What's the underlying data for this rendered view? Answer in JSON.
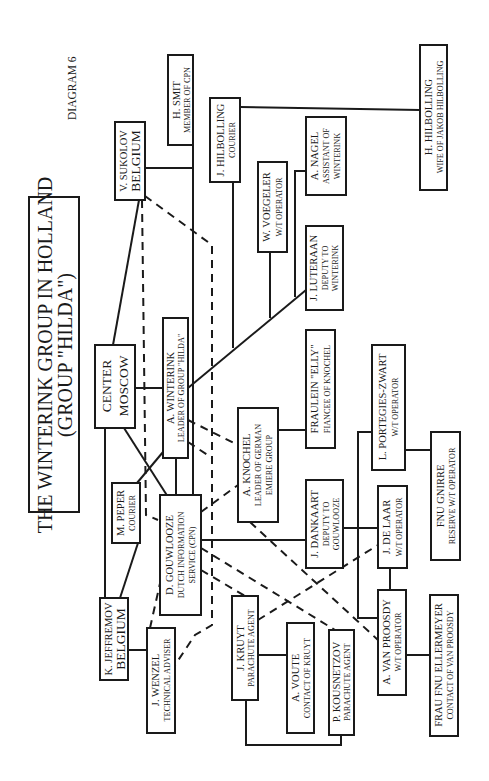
{
  "diagram": {
    "label": "DIAGRAM 6",
    "title_line1": "THE WINTERINK GROUP IN HOLLAND",
    "title_line2": "(GROUP \"HILDA\")",
    "orientation": "rotated 90deg counter-clockwise"
  },
  "nodes": {
    "sukolov": {
      "name": "V. SUKOLOV",
      "role": "BELGIUM"
    },
    "smit": {
      "name": "H. SMIT",
      "role": "MEMBER OF CPN"
    },
    "j_hilbolling": {
      "name": "J. HILBOLLING",
      "role": "COURIER"
    },
    "h_hilbolling": {
      "name": "H. HILBOLLING",
      "role": "WIFE OF JAKOB HILBOLLING"
    },
    "nagel": {
      "name": "A. NAGEL",
      "role1": "ASSISTANT OF",
      "role2": "WINTERINK"
    },
    "voegeler": {
      "name": "W. VOEGELER",
      "role": "W/T OPERATOR"
    },
    "luteraan": {
      "name": "J. LUTERAAN",
      "role1": "DEPUTY TO",
      "role2": "WINTERINK"
    },
    "center": {
      "name": "CENTER",
      "role": "MOSCOW"
    },
    "winterink": {
      "name": "A. WINTERINK",
      "role": "LEADER OF GROUP \"HILDA\""
    },
    "knochel": {
      "name": "A. KNOCHEL",
      "role1": "LEADER OF GERMAN",
      "role2": "EMIERE GROUP"
    },
    "elly": {
      "name": "FRAULEIN \"ELLY\"",
      "role": "FIANCEE OF KNOCHEL"
    },
    "peper": {
      "name": "M. PEPER",
      "role": "COURIER"
    },
    "gouwlooze": {
      "name": "D. GOUWLOOZE",
      "role1": "DUTCH INFORMATION",
      "role2": "SERVICE (CPN)"
    },
    "jeffremov": {
      "name": "K. JEFFREMOV",
      "role": "BELGIUM"
    },
    "wenzel": {
      "name": "J. WENZEL",
      "role": "TECHNICAL ADVISER"
    },
    "kruyt": {
      "name": "J. KRUYT",
      "role": "PARACHUTE AGENT"
    },
    "voute": {
      "name": "A. VOUTE",
      "role": "CONTACT OF KRUYT"
    },
    "kousnetzov": {
      "name": "P. KOUSNETZOV",
      "role": "PARACHUTE AGENT"
    },
    "dankaart": {
      "name": "J. DANKAART",
      "role1": "DEPUTY TO",
      "role2": "GOUWLOOZE"
    },
    "delaar": {
      "name": "J. DE LAAR",
      "role": "W/T OPERATOR"
    },
    "portegies": {
      "name": "L. PORTEGIES-ZWART",
      "role": "W/T OPERATOR"
    },
    "gnirre": {
      "name": "FNU GNIRRE",
      "role": "RESERVE W/T OPERATOR"
    },
    "vanproosdy": {
      "name": "A. VAN PROOSDY",
      "role": "W/T OPERATOR"
    },
    "ellermeyer": {
      "name": "FRAU FNU ELLERMEYER",
      "role": "CONTACT OF VAN PROOSDY"
    }
  },
  "legend": {
    "solid_line": "direct connection",
    "dashed_line": "indirect connection"
  }
}
